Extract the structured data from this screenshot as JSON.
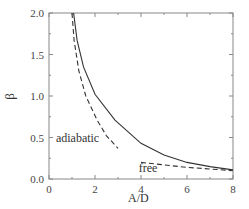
{
  "chart_data": {
    "type": "line",
    "title": "",
    "xlabel": "A/D",
    "ylabel": "β",
    "xlim": [
      0,
      8
    ],
    "ylim": [
      0,
      2.0
    ],
    "xticks": [
      "0",
      "2",
      "4",
      "6",
      "8"
    ],
    "yticks": [
      "0.0",
      "0.5",
      "1.0",
      "1.5",
      "2.0"
    ],
    "grid": false,
    "legend": null,
    "annotations": [
      {
        "text": "adiabatic",
        "x": 0.3,
        "y": 0.5
      },
      {
        "text": "free",
        "x": 3.9,
        "y": 0.13
      }
    ],
    "series": [
      {
        "name": "solid",
        "style": "solid",
        "x": [
          1.07,
          1.22,
          1.5,
          2.0,
          2.87,
          4.0,
          5.0,
          6.0,
          7.0,
          8.0
        ],
        "y": [
          2.0,
          1.67,
          1.35,
          1.02,
          0.71,
          0.43,
          0.29,
          0.2,
          0.15,
          0.11
        ]
      },
      {
        "name": "adiabatic",
        "style": "dashed",
        "x": [
          1.0,
          1.09,
          1.3,
          1.6,
          2.09,
          2.5,
          3.0
        ],
        "y": [
          2.0,
          1.67,
          1.3,
          1.0,
          0.71,
          0.52,
          0.37
        ]
      },
      {
        "name": "free",
        "style": "dashed",
        "x": [
          4.0,
          5.0,
          6.0,
          7.0,
          8.0
        ],
        "y": [
          0.2,
          0.17,
          0.14,
          0.12,
          0.1
        ]
      }
    ]
  }
}
